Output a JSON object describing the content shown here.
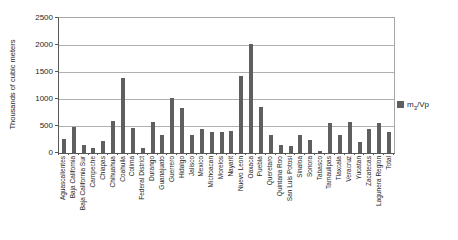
{
  "chart_data": {
    "type": "bar",
    "title": "",
    "xlabel": "",
    "ylabel": "Thousands of cubic meters",
    "ylim": [
      0,
      2500
    ],
    "yticks": [
      0,
      500,
      1000,
      1500,
      2000,
      2500
    ],
    "grid": true,
    "legend": {
      "position": "right",
      "base": "m",
      "sub": "3",
      "rest": "/Vp"
    },
    "series_name": "m3/Vp",
    "categories": [
      "Aguascalientes",
      "Baja California",
      "Baja California Sur",
      "Campeche",
      "Chiapas",
      "Chihuahua",
      "Coahuila",
      "Colima",
      "Federal District",
      "Durango",
      "Guanajuato",
      "Guerrero",
      "Hidalgo",
      "Jalisco",
      "Mexico",
      "Michoacan",
      "Morelos",
      "Nayarit",
      "Nuevo Leon",
      "Oaxaca",
      "Puebla",
      "Queretaro",
      "Quintana Roo",
      "San Luis Potosi",
      "Sinaloa",
      "Sonora",
      "Tabasco",
      "Tamaulipas",
      "Tlaxcala",
      "Veracruz",
      "Yucatan",
      "Zacatecas",
      "Lagunera Region",
      "Total"
    ],
    "values": [
      250,
      480,
      150,
      90,
      220,
      590,
      1390,
      460,
      100,
      570,
      330,
      1020,
      840,
      330,
      450,
      390,
      390,
      400,
      1430,
      2010,
      860,
      330,
      150,
      130,
      330,
      240,
      40,
      550,
      340,
      580,
      200,
      450,
      560,
      390
    ],
    "colors": {
      "bar": "#5f5f5f",
      "gridline": "#b0b0b0",
      "axis": "#595959",
      "frame": "#a6a6a6",
      "text": "#262626",
      "background": "#ffffff"
    }
  }
}
